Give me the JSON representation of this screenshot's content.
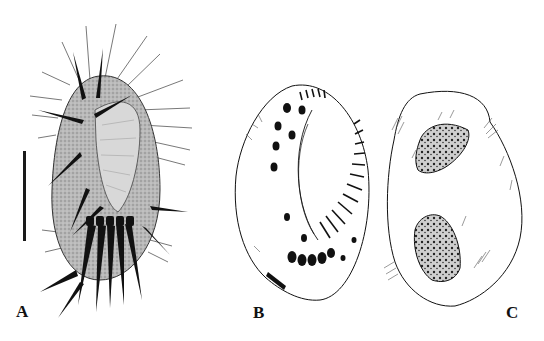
{
  "figure": {
    "panels": [
      {
        "id": "A",
        "label": "A",
        "description": "Ciliate ventral view, stippled body with cirri and scale bar"
      },
      {
        "id": "B",
        "label": "B",
        "description": "Ciliate ventral infraciliature line drawing"
      },
      {
        "id": "C",
        "label": "C",
        "description": "Ciliate dorsal view with two macronuclear nodules"
      }
    ],
    "scale_bar": {
      "visible": true,
      "unit_label": ""
    },
    "colors": {
      "ink": "#111111",
      "stipple": "#9a9a9a",
      "background": "#ffffff"
    }
  }
}
